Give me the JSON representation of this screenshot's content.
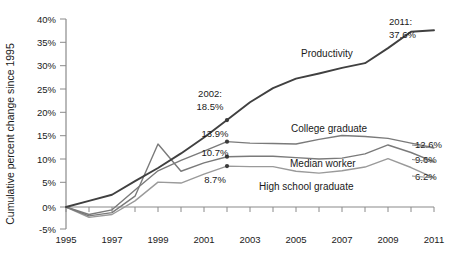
{
  "chart_data": {
    "type": "line",
    "title": "",
    "xlabel": "",
    "ylabel": "Cumulative percent change since 1995",
    "xlim": [
      1995,
      2011
    ],
    "ylim": [
      -5,
      40
    ],
    "grid": false,
    "legend_position": "inline-labels",
    "x": [
      1995,
      1996,
      1997,
      1998,
      1999,
      2000,
      2001,
      2002,
      2003,
      2004,
      2005,
      2006,
      2007,
      2008,
      2009,
      2010,
      2011
    ],
    "y_ticks": [
      "-5%",
      "0%",
      "5%",
      "10%",
      "15%",
      "20%",
      "25%",
      "30%",
      "35%",
      "40%"
    ],
    "y_tick_values": [
      -5,
      0,
      5,
      10,
      15,
      20,
      25,
      30,
      35,
      40
    ],
    "x_ticks": [
      "1995",
      "1997",
      "1999",
      "2001",
      "2003",
      "2005",
      "2007",
      "2009",
      "2011"
    ],
    "x_tick_values": [
      1995,
      1997,
      1999,
      2001,
      2003,
      2005,
      2007,
      2009,
      2011
    ],
    "series": [
      {
        "name": "Productivity",
        "label": "Productivity",
        "color": "#404040",
        "values": [
          0.0,
          1.3,
          2.6,
          5.5,
          8.3,
          11.4,
          14.8,
          18.5,
          22.3,
          25.3,
          27.3,
          28.4,
          29.6,
          30.6,
          33.8,
          37.3,
          37.6
        ]
      },
      {
        "name": "College graduate",
        "label": "College graduate",
        "color": "#7a7a7a",
        "values": [
          0.0,
          -1.6,
          -0.6,
          3.6,
          7.7,
          9.9,
          11.9,
          13.9,
          13.6,
          13.5,
          13.4,
          14.4,
          15.2,
          15.0,
          14.6,
          13.6,
          12.6
        ]
      },
      {
        "name": "Median worker",
        "label": "Median worker",
        "color": "#7a7a7a",
        "values": [
          0.0,
          -1.9,
          -1.2,
          2.3,
          13.4,
          7.6,
          9.4,
          10.7,
          10.8,
          10.8,
          10.5,
          10.2,
          10.4,
          11.3,
          13.2,
          11.6,
          9.6
        ]
      },
      {
        "name": "High school graduate",
        "label": "High school graduate",
        "color": "#9a9a9a",
        "values": [
          0.0,
          -2.2,
          -1.6,
          1.3,
          5.3,
          5.1,
          7.0,
          8.7,
          8.6,
          8.6,
          7.6,
          7.2,
          7.7,
          8.5,
          10.3,
          8.4,
          6.2
        ]
      }
    ],
    "annotations": [
      {
        "name": "productivity-2011",
        "text_lines": [
          "2011:",
          "37.6%"
        ],
        "series": "Productivity",
        "x": 2011,
        "y": 37.6,
        "align": "right"
      },
      {
        "name": "productivity-2002",
        "text_lines": [
          "2002:",
          "18.5%"
        ],
        "series": "Productivity",
        "x": 2002,
        "y": 18.5,
        "align": "mid-above"
      },
      {
        "name": "college-2002",
        "text_lines": [
          "13.9%"
        ],
        "series": "College graduate",
        "x": 2002,
        "y": 13.9,
        "align": "mid-above"
      },
      {
        "name": "median-2002",
        "text_lines": [
          "10.7%"
        ],
        "series": "Median worker",
        "x": 2002,
        "y": 10.7,
        "align": "mid-above"
      },
      {
        "name": "highschool-2002",
        "text_lines": [
          "8.7%"
        ],
        "series": "High school graduate",
        "x": 2002,
        "y": 8.7,
        "align": "mid-below"
      },
      {
        "name": "college-2011",
        "text_lines": [
          "12.6%"
        ],
        "series": "College graduate",
        "x": 2011,
        "y": 12.6,
        "align": "right"
      },
      {
        "name": "median-2011",
        "text_lines": [
          "9.6%"
        ],
        "series": "Median worker",
        "x": 2011,
        "y": 9.6,
        "align": "right"
      },
      {
        "name": "highschool-2011",
        "text_lines": [
          "6.2%"
        ],
        "series": "High school graduate",
        "x": 2011,
        "y": 6.2,
        "align": "right"
      }
    ]
  },
  "labels": {
    "y_axis_title": "Cumulative percent change since 1995",
    "productivity": "Productivity",
    "college": "College graduate",
    "median": "Median worker",
    "highschool": "High school graduate",
    "ann_2011_line1": "2011:",
    "ann_2011_line2": "37.6%",
    "ann_2002_line1": "2002:",
    "ann_2002_line2": "18.5%",
    "ann_college_2002": "13.9%",
    "ann_median_2002": "10.7%",
    "ann_highschool_2002": "8.7%",
    "ann_college_2011": "12.6%",
    "ann_median_2011": "9.6%",
    "ann_highschool_2011": "6.2%",
    "y_tick_40": "40%",
    "y_tick_35": "35%",
    "y_tick_30": "30%",
    "y_tick_25": "25%",
    "y_tick_20": "20%",
    "y_tick_15": "15%",
    "y_tick_10": "10%",
    "y_tick_5": "5%",
    "y_tick_0": "0%",
    "y_tick_neg5": "-5%",
    "x_tick_1995": "1995",
    "x_tick_1997": "1997",
    "x_tick_1999": "1999",
    "x_tick_2001": "2001",
    "x_tick_2003": "2003",
    "x_tick_2005": "2005",
    "x_tick_2007": "2007",
    "x_tick_2009": "2009",
    "x_tick_2011": "2011"
  }
}
